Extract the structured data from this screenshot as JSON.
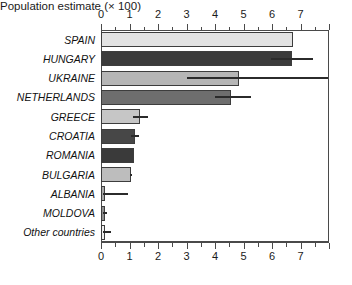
{
  "chart_data": {
    "type": "bar",
    "orientation": "horizontal",
    "title": "",
    "xlabel": "Population estimate (× 100)",
    "ylabel": "",
    "xlim": [
      0,
      8
    ],
    "xticks": [
      0,
      1,
      2,
      3,
      4,
      5,
      6,
      7
    ],
    "xticklabels": [
      "0",
      "1",
      "2",
      "3",
      "4",
      "5",
      "6",
      "7"
    ],
    "minor_ticks": true,
    "grid": false,
    "legend": null,
    "dual_x_axis": true,
    "categories": [
      "SPAIN",
      "HUNGARY",
      "UKRAINE",
      "NETHERLANDS",
      "GREECE",
      "CROATIA",
      "ROMANIA",
      "BULGARIA",
      "ALBANIA",
      "MOLDOVA",
      "Other countries"
    ],
    "values": [
      6.75,
      6.7,
      4.85,
      4.55,
      1.38,
      1.2,
      1.17,
      1.05,
      0.08,
      0.07,
      0.07
    ],
    "error_low": [
      6.75,
      5.95,
      3.0,
      4.0,
      1.12,
      1.05,
      1.17,
      1.0,
      0.08,
      0.07,
      0.07
    ],
    "error_high": [
      6.75,
      7.45,
      7.95,
      5.25,
      1.65,
      1.35,
      1.17,
      1.1,
      0.95,
      0.2,
      0.35
    ],
    "bar_colors": [
      "#e2e2e2",
      "#3b3b3b",
      "#b6b6b6",
      "#6e6e6e",
      "#c6c6c6",
      "#474747",
      "#3a3a3a",
      "#bdbdbd",
      "#a8a8a8",
      "#8f8f8f",
      "#f0f0f0"
    ],
    "bar_edge_color": "#3d3d3d",
    "error_color": "#2b2b2b",
    "axis_color": "#4a4a4a",
    "background": "#ffffff"
  }
}
